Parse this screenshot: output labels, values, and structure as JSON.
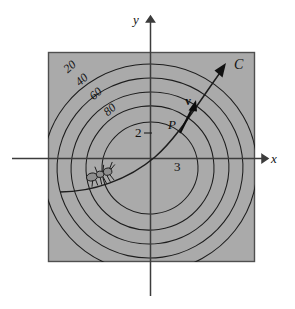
{
  "figure": {
    "kind": "vector-calculus-diagram",
    "background_color": "#ffffff",
    "plot_region_fill": "#aaaaaa",
    "plot_region_stroke": "#4a4a4a",
    "line_color": "#1a1a1a",
    "axis_color": "#3c3c3c"
  },
  "axes": {
    "x_label": "x",
    "y_label": "y",
    "x_axis": {
      "x1": 12,
      "y1": 158,
      "x2": 266,
      "y2": 158
    },
    "y_axis": {
      "x1": 150,
      "y1": 296,
      "x2": 150,
      "y2": 17
    },
    "x_label_pos": {
      "x": 272,
      "y": 160
    },
    "y_label_pos": {
      "x": 133,
      "y": 16
    }
  },
  "plot_region": {
    "x": 48,
    "y": 52,
    "width": 207,
    "height": 210
  },
  "contours": {
    "center": {
      "x": 150,
      "y": 168
    },
    "labels": [
      {
        "text": "20",
        "x": 68,
        "y": 72,
        "rotate": -42
      },
      {
        "text": "40",
        "x": 80,
        "y": 84,
        "rotate": -42
      },
      {
        "text": "60",
        "x": 93,
        "y": 97,
        "rotate": -42
      },
      {
        "text": "80",
        "x": 107,
        "y": 112,
        "rotate": -42
      }
    ],
    "radii": [
      105,
      92,
      78,
      64,
      50
    ],
    "values": [
      20,
      40,
      60,
      80,
      100
    ]
  },
  "level_labels": [
    {
      "text": "2",
      "x": 136,
      "y": 128
    },
    {
      "text": "3",
      "x": 176,
      "y": 161
    }
  ],
  "curve": {
    "name": "C",
    "label": "C",
    "label_pos": {
      "x": 235,
      "y": 61
    },
    "arrow_tip": {
      "x": 224,
      "y": 67
    }
  },
  "point": {
    "label": "P",
    "label_pos": {
      "x": 170,
      "y": 118
    },
    "marker": {
      "x": 186,
      "y": 122
    }
  },
  "vector": {
    "label": "v",
    "label_pos": {
      "x": 186,
      "y": 99
    },
    "tail": {
      "x": 181,
      "y": 130
    },
    "tip": {
      "x": 194,
      "y": 104
    }
  },
  "ant": {
    "label": "ant",
    "pos": {
      "x": 105,
      "y": 176
    }
  }
}
